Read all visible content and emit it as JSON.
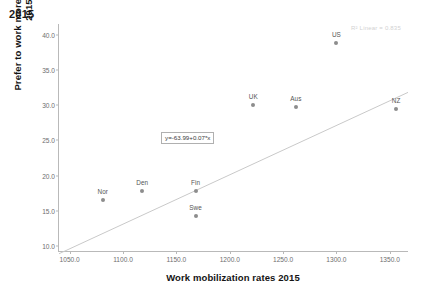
{
  "chart_data": {
    "type": "scatter",
    "title": "2015",
    "xlabel": "Work mobilization rates 2015",
    "ylabel": "Prefer to work more and earn more 2015",
    "xlim": [
      1040,
      1368
    ],
    "ylim": [
      9.2,
      41.5
    ],
    "xticks": [
      "1050.0",
      "1100.0",
      "1150.0",
      "1200.0",
      "1250.0",
      "1300.0",
      "1350.0"
    ],
    "xtick_values": [
      1050,
      1100,
      1150,
      1200,
      1250,
      1300,
      1350
    ],
    "yticks": [
      "10.0",
      "15.0",
      "20.0",
      "25.0",
      "30.0",
      "35.0",
      "40.0"
    ],
    "ytick_values": [
      10,
      15,
      20,
      25,
      30,
      35,
      40
    ],
    "grid": false,
    "legend": "none",
    "points": [
      {
        "label": "Nor",
        "x": 1081,
        "y": 16.5
      },
      {
        "label": "Den",
        "x": 1118,
        "y": 17.8
      },
      {
        "label": "Fin",
        "x": 1168,
        "y": 17.8
      },
      {
        "label": "Swe",
        "x": 1168,
        "y": 14.3
      },
      {
        "label": "UK",
        "x": 1222,
        "y": 30.0
      },
      {
        "label": "Aus",
        "x": 1262,
        "y": 29.8
      },
      {
        "label": "US",
        "x": 1300,
        "y": 38.8
      },
      {
        "label": "NZ",
        "x": 1356,
        "y": 29.4
      }
    ],
    "fit_line": {
      "equation": "y=-63.99+0.07*x",
      "intercept": -63.99,
      "slope": 0.07,
      "x_start": 1040,
      "x_end": 1368
    },
    "annotation_r2": "R² Linear = 0.835",
    "marker_color": "#8d8d8d",
    "line_color": "#c9c9c9",
    "axis_color": "#b9b9b9",
    "label_color": "#555555"
  }
}
